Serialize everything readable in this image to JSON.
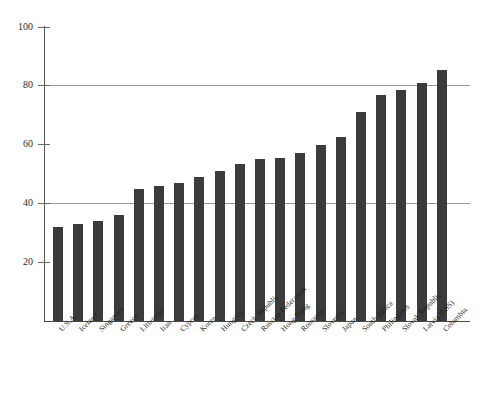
{
  "chart_data": {
    "type": "bar",
    "title": "",
    "subtitle": "",
    "xlabel": "",
    "ylabel": "",
    "ylim": [
      0,
      100
    ],
    "xlim_note": "categorical",
    "grid": "horizontal gridlines at 40 and 80",
    "gridlines": [
      40,
      80
    ],
    "legend": "none",
    "legend_position": "none",
    "bar_color": "#3b3b3b",
    "axis_color": "#4a4a4a",
    "gridline_color": "#9a9a9a",
    "background_color": "#ffffff",
    "yticks": [
      20,
      40,
      60,
      80,
      100
    ],
    "ytick_labels": [
      "20",
      "40",
      "60",
      "80",
      "100"
    ],
    "categories": [
      "U.S.A.",
      "Iceland",
      "Singapore",
      "Greece",
      "Lithuania",
      "Iran",
      "Cyprus",
      "Korea",
      "Hungary",
      "Czech Republic",
      "Russian Federation",
      "Hong Kong",
      "Romania",
      "Slovenia",
      "Japan",
      "South Africa",
      "Philippines",
      "Slovak Republic",
      "Latvia (LSS)",
      "Colombia"
    ],
    "values": [
      32,
      33,
      34,
      36,
      45,
      46,
      47,
      49,
      51,
      53.5,
      55,
      55.5,
      57,
      60,
      62.5,
      71,
      77,
      78.5,
      81,
      85.5
    ]
  }
}
